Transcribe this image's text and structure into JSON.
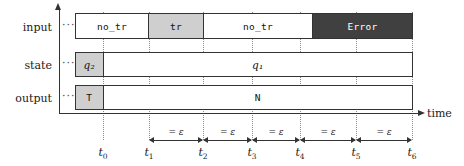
{
  "diagram": {
    "axis": {
      "time_label": "time",
      "vertical_axis": "signal-axis",
      "horizontal_axis": "time-axis"
    },
    "rows": [
      {
        "label": "input",
        "leader": "···",
        "segments": [
          {
            "text": "no_tr",
            "fill": "white",
            "from": "start",
            "to": "t1"
          },
          {
            "text": "tr",
            "fill": "gray",
            "from": "t1",
            "to": "t2"
          },
          {
            "text": "no_tr",
            "fill": "white",
            "from": "t2",
            "to": "t4b"
          },
          {
            "text": "Error",
            "fill": "dark",
            "from": "t4b",
            "to": "t6"
          }
        ]
      },
      {
        "label": "state",
        "leader": "···",
        "segments": [
          {
            "text": "q₂",
            "fill": "gray",
            "from": "start",
            "to": "t0"
          },
          {
            "text": "q₁",
            "fill": "white",
            "from": "t0",
            "to": "t6"
          }
        ]
      },
      {
        "label": "output",
        "leader": "···",
        "segments": [
          {
            "text": "T",
            "fill": "gray",
            "from": "start",
            "to": "t0"
          },
          {
            "text": "N",
            "fill": "white",
            "from": "t0",
            "to": "t6"
          }
        ]
      }
    ],
    "ticks": [
      {
        "name": "t0",
        "label": "t",
        "subscript": "0",
        "x": 103
      },
      {
        "name": "t1",
        "label": "t",
        "subscript": "1",
        "x": 149
      },
      {
        "name": "t2",
        "label": "t",
        "subscript": "2",
        "x": 203
      },
      {
        "name": "t3",
        "label": "t",
        "subscript": "3",
        "x": 252
      },
      {
        "name": "t4",
        "label": "t",
        "subscript": "4",
        "x": 300
      },
      {
        "name": "t5",
        "label": "t",
        "subscript": "5",
        "x": 356
      },
      {
        "name": "t6",
        "label": "t",
        "subscript": "6",
        "x": 412
      }
    ],
    "intervals": [
      {
        "from": "t1",
        "to": "t2",
        "label": "= ε"
      },
      {
        "from": "t2",
        "to": "t3",
        "label": "= ε"
      },
      {
        "from": "t3",
        "to": "t4",
        "label": "= ε"
      },
      {
        "from": "t4",
        "to": "t5",
        "label": "= ε"
      },
      {
        "from": "t5",
        "to": "t6",
        "label": "= ε"
      }
    ],
    "colors": {
      "white_fill": "#ffffff",
      "gray_fill": "#cfcfcf",
      "dark_fill": "#404040",
      "stroke": "#333333",
      "dotted_guide": "#8a8a8a"
    }
  }
}
